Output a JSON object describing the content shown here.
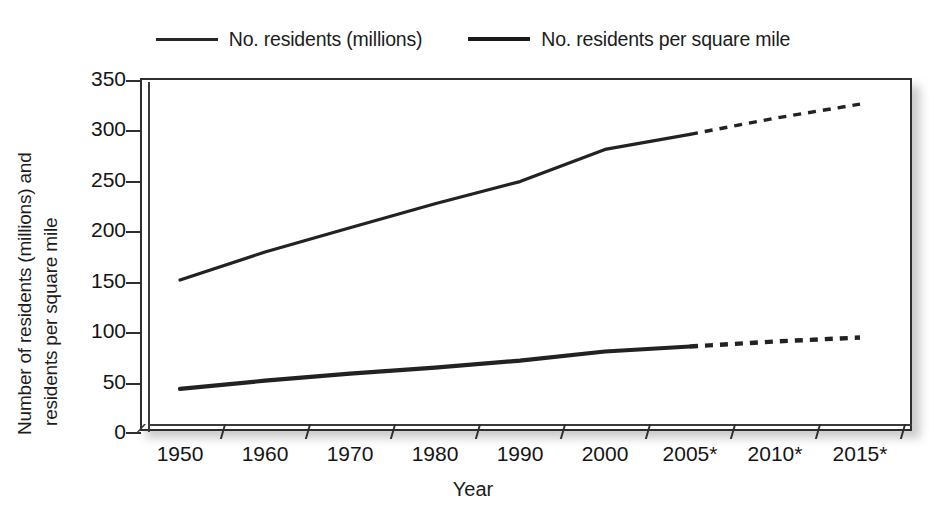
{
  "legend": {
    "entries": [
      {
        "label": "No. residents (millions)",
        "swatch": "line-thin-icon"
      },
      {
        "label": "No. residents per square mile",
        "swatch": "line-thick-icon"
      }
    ]
  },
  "axes": {
    "y_title_line_1": "Number of residents (millions) and",
    "y_title_line_2": "residents per square mile",
    "x_title": "Year"
  },
  "chart_data": {
    "type": "line",
    "title": "",
    "xlabel": "Year",
    "ylabel": "Number of residents (millions) and residents per square mile",
    "categories": [
      "1950",
      "1960",
      "1970",
      "1980",
      "1990",
      "2000",
      "2005*",
      "2010*",
      "2015*"
    ],
    "ytick_labels": [
      "0",
      "50",
      "100",
      "150",
      "200",
      "250",
      "300",
      "350"
    ],
    "ytick_values": [
      0,
      50,
      100,
      150,
      200,
      250,
      300,
      350
    ],
    "ylim": [
      0,
      350
    ],
    "grid": false,
    "legend_position": "top-center",
    "projection_note": "* denotes projected values (dashed line segments)",
    "series": [
      {
        "name": "No. residents (millions)",
        "values": [
          151,
          179,
          203,
          227,
          249,
          281,
          296,
          312,
          326
        ],
        "solid_through": "2005*",
        "dashed_from": "2005*",
        "style": "thin"
      },
      {
        "name": "No. residents per square mile",
        "values": [
          43,
          51,
          58,
          64,
          71,
          80,
          85,
          90,
          94
        ],
        "solid_through": "2005*",
        "dashed_from": "2005*",
        "style": "thick"
      }
    ]
  }
}
